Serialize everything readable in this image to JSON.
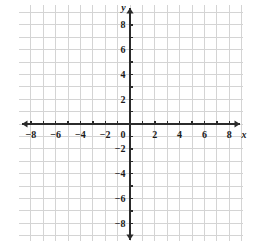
{
  "chart_data": {
    "type": "scatter",
    "title": "",
    "xlabel": "x",
    "ylabel": "y",
    "xlim": [
      -9,
      9
    ],
    "ylim": [
      -9,
      9
    ],
    "grid": true,
    "grid_step": 1,
    "tick_step": 1,
    "label_step": 2,
    "legend": "none",
    "series": [],
    "x_tick_labels": [
      "−8",
      "−6",
      "−4",
      "−2",
      "0",
      "2",
      "4",
      "6",
      "8"
    ],
    "x_tick_values": [
      -8,
      -6,
      -4,
      -2,
      0,
      2,
      4,
      6,
      8
    ],
    "y_tick_labels": [
      "8",
      "6",
      "4",
      "2",
      "−2",
      "−4",
      "−6",
      "−8"
    ],
    "y_tick_values": [
      8,
      6,
      4,
      2,
      -2,
      -4,
      -6,
      -8
    ],
    "origin_label": "0",
    "colors": {
      "grid": "#d4d4d4",
      "axis": "#2b2b2b",
      "text": "#1a1a1a",
      "background": "#ffffff"
    }
  },
  "axes": {
    "x_label": "x",
    "y_label": "y"
  },
  "ticks": {
    "x": [
      {
        "value": -8,
        "label": "−8"
      },
      {
        "value": -7,
        "label": ""
      },
      {
        "value": -6,
        "label": "−6"
      },
      {
        "value": -5,
        "label": ""
      },
      {
        "value": -4,
        "label": "−4"
      },
      {
        "value": -3,
        "label": ""
      },
      {
        "value": -2,
        "label": "−2"
      },
      {
        "value": -1,
        "label": ""
      },
      {
        "value": 1,
        "label": ""
      },
      {
        "value": 2,
        "label": "2"
      },
      {
        "value": 3,
        "label": ""
      },
      {
        "value": 4,
        "label": "4"
      },
      {
        "value": 5,
        "label": ""
      },
      {
        "value": 6,
        "label": "6"
      },
      {
        "value": 7,
        "label": ""
      },
      {
        "value": 8,
        "label": "8"
      }
    ],
    "y": [
      {
        "value": 8,
        "label": "8"
      },
      {
        "value": 7,
        "label": ""
      },
      {
        "value": 6,
        "label": "6"
      },
      {
        "value": 5,
        "label": ""
      },
      {
        "value": 4,
        "label": "4"
      },
      {
        "value": 3,
        "label": ""
      },
      {
        "value": 2,
        "label": "2"
      },
      {
        "value": 1,
        "label": ""
      },
      {
        "value": -1,
        "label": ""
      },
      {
        "value": -2,
        "label": "−2"
      },
      {
        "value": -3,
        "label": ""
      },
      {
        "value": -4,
        "label": "−4"
      },
      {
        "value": -5,
        "label": ""
      },
      {
        "value": -6,
        "label": "−6"
      },
      {
        "value": -7,
        "label": ""
      },
      {
        "value": -8,
        "label": "−8"
      }
    ],
    "origin": "0"
  }
}
